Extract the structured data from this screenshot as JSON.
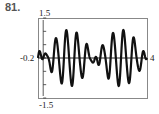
{
  "problem_number": "81.",
  "chart_data": {
    "type": "line",
    "title": "",
    "xlabel": "",
    "ylabel": "",
    "xlim": [
      -0.2,
      4
    ],
    "ylim": [
      -1.5,
      1.5
    ],
    "window_labels": {
      "xmin": "-0.2",
      "xmax": "4",
      "ymin": "-1.5",
      "ymax": "1.5"
    },
    "grid": false,
    "legend": null,
    "series": [
      {
        "name": "f(x)",
        "description": "oscillation with beat envelope, zero-amplitude near x=0, 2, 4; peaks ~±1 near x=1 and x=3",
        "x": [
          0,
          0.5,
          1.0,
          1.5,
          2.0,
          2.5,
          3.0,
          3.5,
          4.0
        ],
        "envelope": [
          0.1,
          0.75,
          1.05,
          0.75,
          0.1,
          0.75,
          1.05,
          0.75,
          0.1
        ]
      }
    ]
  }
}
